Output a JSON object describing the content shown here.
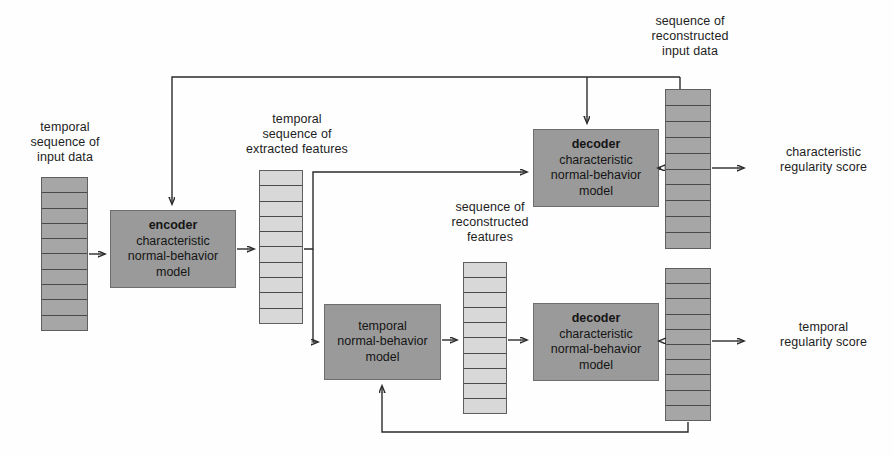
{
  "diagram": {
    "colors": {
      "dark_fill": "#9a9a9a",
      "light_fill": "#d8d8d8",
      "stroke": "#2b2b2b",
      "text": "#1d1d1d"
    }
  },
  "labels": {
    "input_sequence": "temporal\nsequence of\ninput data",
    "extracted_features": "temporal\nsequence of\nextracted features",
    "reconstructed_input": "sequence of\nreconstructed\ninput data",
    "reconstructed_features": "sequence of\nreconstructed\nfeatures",
    "characteristic_score": "characteristic\nregularity score",
    "temporal_score": "temporal\nregularity score"
  },
  "boxes": {
    "encoder": {
      "title": "encoder",
      "line1": "characteristic",
      "line2": "normal-behavior",
      "line3": "model"
    },
    "decoder_top": {
      "title": "decoder",
      "line1": "characteristic",
      "line2": "normal-behavior",
      "line3": "model"
    },
    "temporal_model": {
      "title": "",
      "line1": "temporal",
      "line2": "normal-behavior",
      "line3": "model"
    },
    "decoder_bottom": {
      "title": "decoder",
      "line1": "characteristic",
      "line2": "normal-behavior",
      "line3": "model"
    }
  },
  "columns": {
    "input_data": {
      "segments": 10,
      "shade": "dark"
    },
    "extracted_features": {
      "segments": 10,
      "shade": "light"
    },
    "reconstructed_features": {
      "segments": 10,
      "shade": "light"
    },
    "reconstructed_input": {
      "segments": 10,
      "shade": "dark"
    },
    "temporal_output": {
      "segments": 10,
      "shade": "dark"
    }
  }
}
